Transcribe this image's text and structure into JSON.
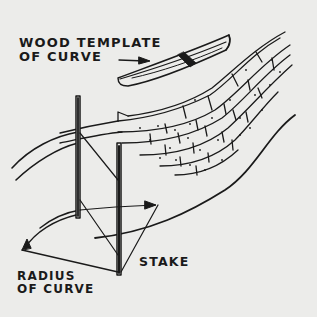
{
  "figure": {
    "type": "technical-illustration",
    "colors": {
      "background": "#ececea",
      "ink": "#1a1a1a"
    }
  },
  "labels": {
    "template": {
      "line1": "WOOD TEMPLATE",
      "line2": "OF CURVE"
    },
    "radius": {
      "line1": "RADIUS",
      "line2": "OF CURVE"
    },
    "stake": "STAKE"
  },
  "elements": {
    "template": "wood-template",
    "wall": "curved-block-wall",
    "stakes": [
      "stake-left",
      "stake-right"
    ],
    "guides": [
      "radius-arc-arrow",
      "string-lines",
      "ground-curve"
    ]
  }
}
